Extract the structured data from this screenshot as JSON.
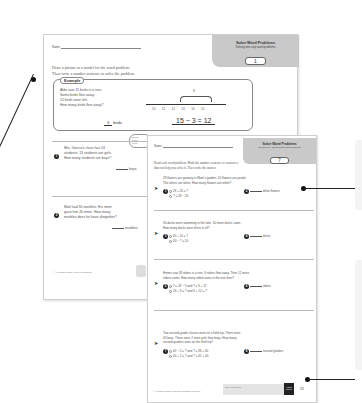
{
  "page1": {
    "name_label": "Name",
    "title": "Solve Word Problems",
    "subtitle": "Solving one-step word problems",
    "lesson_number": "1",
    "instructions_line1": "Draw a picture or a model for the word problem.",
    "instructions_line2": "Then write a number sentence to solve the problem.",
    "example": {
      "label": "Example",
      "lines": [
        "Aldo saw 15 birds in a tree.",
        "Some birds flew away.",
        "12 birds were left.",
        "How many birds flew away?"
      ],
      "answer_value": "3",
      "answer_unit": "birds",
      "number_sentence": "15 − 3 = 12",
      "numberline_ticks": [
        "10",
        "11",
        "12",
        "13",
        "14",
        "15"
      ],
      "jump_label": "3"
    },
    "cloud_text": [
      "Chool",
      "a mo",
      "to so"
    ],
    "problems": [
      {
        "number": "1",
        "text": [
          "Mrs. Garcia's class has 24",
          "students. 13 students are girls.",
          "How many students are boys?"
        ],
        "unit": "boys"
      },
      {
        "number": "2",
        "text": [
          "Matt had 30 marbles. His mom",
          "gave him 20 more. How many",
          "marbles does he have altogether?"
        ],
        "unit": "marbles"
      }
    ],
    "footer": "© Houghton Mifflin Harcourt Publishing"
  },
  "page2": {
    "name_label": "Name",
    "title": "Solve Word Problems",
    "subtitle": "Solving one- and two-step word problems",
    "lesson_number": "7",
    "instructions_line1": "Read each word problem. Mark the number sentence or sentences",
    "instructions_line2": "that can help you solve it. Then write the answer.",
    "problems": [
      {
        "text": [
          "28 flowers are growing in Mom's garden. 20 flowers are purple.",
          "The others are white. How many flowers are white?"
        ],
        "q1": "1",
        "choices": [
          "28 + 20 = ?",
          "? = 28 − 20"
        ],
        "q2": "2",
        "unit": "white flowers"
      },
      {
        "text": [
          "30 ducks were swimming in the lake. 10 more ducks came.",
          "How many ducks were there in all?"
        ],
        "q1": "3",
        "choices": [
          "30 + 10 = ?",
          "30 − ? = 10"
        ],
        "q2": "4",
        "unit": "ducks"
      },
      {
        "text": [
          "Emma saw 18 robins in a tree. 9 robins flew away. Then 12 more",
          "robins came. How many robins were in the tree then?"
        ],
        "q1": "5",
        "choices": [
          "? = 18 − 9 and ? = 9 + 12",
          "18 + 9 = ? and 9 + 12 = ?"
        ],
        "q2": "6",
        "unit": "robins"
      },
      {
        "text": [
          "Two second-grade classes went on a field trip. There were",
          "40 boys. There were 2 more girls than boys. How many",
          "second graders went on the field trip?"
        ],
        "q1": "7",
        "choices": [
          "40 − 2 = ? and ? = 38 + 40",
          "40 + 2 = ? and ? = 42 + 40"
        ],
        "q2": "8",
        "unit": "second graders"
      }
    ],
    "footer": "© Houghton Mifflin Harcourt Publishing Company",
    "footer_note": "Take home activity",
    "badge": "CORE SKILLS",
    "page_number": "25"
  }
}
